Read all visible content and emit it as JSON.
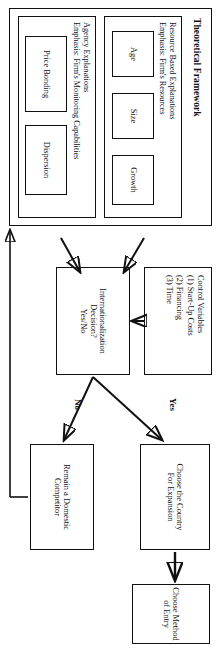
{
  "diagram": {
    "title": "Theoretical Framework",
    "orientation": "rotated-90-clockwise",
    "framework": {
      "heading": "Theoretical Framework",
      "groups": [
        {
          "name": "resource-based",
          "title_line1": "Resource Based Explanations",
          "title_line2": "Emphasis: Firm's Resources",
          "items": [
            "Age",
            "Size",
            "Growth"
          ]
        },
        {
          "name": "agency",
          "title_line1": "Agency Explanations",
          "title_line2": "Emphasis: Firm's Monitoring Capabilities",
          "items": [
            "Price Bonding",
            "Dispersion"
          ]
        }
      ]
    },
    "control_variables": {
      "heading": "Control Variables",
      "items": [
        "(1) Start-Up Costs",
        "(2) Financing",
        "(3) Time"
      ]
    },
    "decision": {
      "line1": "Internationalization",
      "line2": "Decision?",
      "line3": "Yes/No"
    },
    "branch_labels": {
      "yes": "Yes",
      "no": "No"
    },
    "outcomes": {
      "yes_path": {
        "line1": "Choose the Country",
        "line2": "For Expansion"
      },
      "final": {
        "line1": "Choose Method",
        "line2": "of Entry"
      },
      "no_path": {
        "line1": "Remain a Domestic",
        "line2": "Competitor"
      }
    },
    "colors": {
      "ink": "#111111",
      "paper": "#ffffff"
    }
  }
}
